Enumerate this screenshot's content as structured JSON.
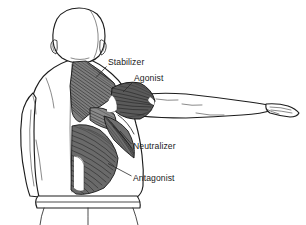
{
  "figure": {
    "view": "posterior",
    "background_color": "#ffffff",
    "line_color": "#1d1d1d",
    "label_color": "#1a1a1a",
    "muscle_shade_color": "#141414",
    "width": 306,
    "height": 225
  },
  "labels": [
    {
      "id": "stabilizer",
      "text": "Stabilizer",
      "text_x": 108,
      "text_y": 65,
      "leader": "M 106.5,66.5 L 96,77.5",
      "target_muscle": "trapezius"
    },
    {
      "id": "agonist",
      "text": "Agonist",
      "text_x": 134,
      "text_y": 81,
      "leader": "M 132.5,82.5 L 123,92",
      "target_muscle": "deltoid"
    },
    {
      "id": "neutralizer",
      "text": "Neutralizer",
      "text_x": 133,
      "text_y": 149,
      "leader": "M 131.5,144 L 120,131",
      "target_muscle": "teres-major"
    },
    {
      "id": "antagonist",
      "text": "Antagonist",
      "text_x": 133,
      "text_y": 181,
      "leader": "M 131.5,176 L 108,163.5",
      "target_muscle": "latissimus-dorsi"
    }
  ],
  "body_parts": [
    {
      "id": "head",
      "name": "head"
    },
    {
      "id": "ear-left",
      "name": "left ear"
    },
    {
      "id": "ear-right",
      "name": "right ear"
    },
    {
      "id": "neck",
      "name": "neck"
    },
    {
      "id": "torso",
      "name": "torso"
    },
    {
      "id": "left-arm",
      "name": "left arm at side"
    },
    {
      "id": "right-arm",
      "name": "right arm abducted"
    },
    {
      "id": "hand",
      "name": "right hand"
    },
    {
      "id": "waistband",
      "name": "waistband"
    },
    {
      "id": "legs",
      "name": "legs"
    }
  ]
}
